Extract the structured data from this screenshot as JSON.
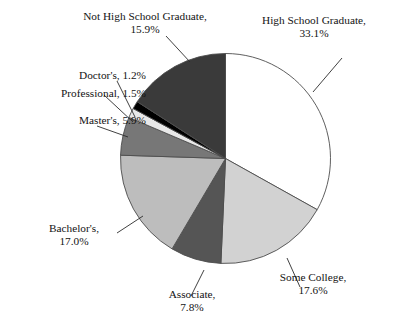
{
  "chart_data": {
    "type": "pie",
    "title": "",
    "subtitle": "",
    "legend_position": "labels-with-leader-lines",
    "grid": false,
    "start_angle_deg": 0,
    "direction": "clockwise",
    "categories": [
      "High School Graduate",
      "Some College",
      "Associate",
      "Bachelor's",
      "Master's",
      "Professional",
      "Doctor's",
      "Not High School Graduate"
    ],
    "values": [
      33.1,
      17.6,
      7.8,
      17.0,
      5.9,
      1.5,
      1.2,
      15.9
    ],
    "value_unit": "%",
    "slice_colors": [
      "#ffffff",
      "#d2d2d2",
      "#555555",
      "#bdbdbd",
      "#777777",
      "#e8e8e8",
      "#000000",
      "#3a3a3a"
    ],
    "slice_edge_color": "#4d4d4d",
    "slices": [
      {
        "name": "High School Graduate",
        "value": 33.1,
        "color": "#ffffff"
      },
      {
        "name": "Some College",
        "value": 17.6,
        "color": "#d2d2d2"
      },
      {
        "name": "Associate",
        "value": 7.8,
        "color": "#555555"
      },
      {
        "name": "Bachelor's",
        "value": 17.0,
        "color": "#bdbdbd"
      },
      {
        "name": "Master's",
        "value": 5.9,
        "color": "#777777"
      },
      {
        "name": "Professional",
        "value": 1.5,
        "color": "#e8e8e8"
      },
      {
        "name": "Doctor's",
        "value": 1.2,
        "color": "#000000"
      },
      {
        "name": "Not High School Graduate",
        "value": 15.9,
        "color": "#3a3a3a"
      }
    ]
  },
  "labels": {
    "not_high_school_graduate": {
      "line1": "Not High School Graduate,",
      "line2": "15.9%"
    },
    "high_school_graduate": {
      "line1": "High School Graduate,",
      "line2": "33.1%"
    },
    "doctors": {
      "line1": "Doctor's, 1.2%"
    },
    "professional": {
      "line1": "Professional, 1.5%"
    },
    "masters": {
      "line1": "Master's, 5.9%"
    },
    "bachelors": {
      "line1": "Bachelor's,",
      "line2": "17.0%"
    },
    "associate": {
      "line1": "Associate,",
      "line2": "7.8%"
    },
    "some_college": {
      "line1": "Some College,",
      "line2": "17.6%"
    }
  }
}
